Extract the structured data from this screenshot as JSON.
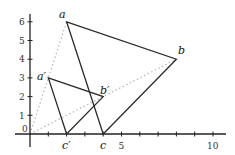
{
  "diagram": {
    "origin_label": "0",
    "x_ticks": [
      {
        "value": 1,
        "label": ""
      },
      {
        "value": 2,
        "label": ""
      },
      {
        "value": 3,
        "label": ""
      },
      {
        "value": 4,
        "label": ""
      },
      {
        "value": 5,
        "label": "5"
      },
      {
        "value": 6,
        "label": ""
      },
      {
        "value": 7,
        "label": ""
      },
      {
        "value": 8,
        "label": ""
      },
      {
        "value": 9,
        "label": ""
      },
      {
        "value": 10,
        "label": "10"
      }
    ],
    "y_ticks": [
      {
        "value": 1,
        "label": "1"
      },
      {
        "value": 2,
        "label": "2"
      },
      {
        "value": 3,
        "label": "3"
      },
      {
        "value": 4,
        "label": "4"
      },
      {
        "value": 5,
        "label": "5"
      },
      {
        "value": 6,
        "label": "6"
      }
    ],
    "points": {
      "a": {
        "label": "a",
        "x": 2,
        "y": 6
      },
      "b": {
        "label": "b",
        "x": 8,
        "y": 4
      },
      "c": {
        "label": "c",
        "x": 4,
        "y": 0
      },
      "a_prime": {
        "label": "a′",
        "x": 1,
        "y": 3
      },
      "b_prime": {
        "label": "b′",
        "x": 4,
        "y": 2
      },
      "c_prime": {
        "label": "c′",
        "x": 2,
        "y": 0
      }
    },
    "triangles": [
      {
        "name": "abc",
        "vertices": [
          "a",
          "b",
          "c"
        ]
      },
      {
        "name": "a'b'c'",
        "vertices": [
          "a′",
          "b′",
          "c′"
        ]
      }
    ],
    "rays_from_origin": [
      "a",
      "b"
    ],
    "colors": {
      "lines": "#2a2a2a",
      "dotted": "#b0b0b0",
      "axes": "#222222"
    }
  }
}
